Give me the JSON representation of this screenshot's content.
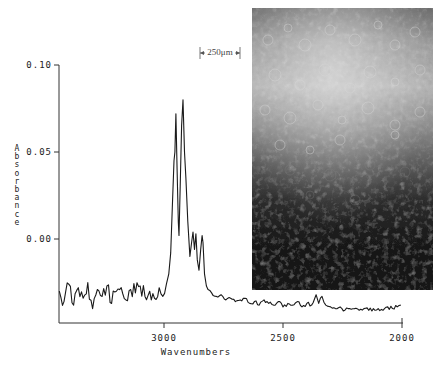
{
  "chart_data": {
    "type": "line",
    "title": "",
    "xlabel": "Wavenumbers",
    "ylabel": "Absorbance",
    "xlim": [
      3445,
      2000
    ],
    "ylim": [
      -0.048,
      0.1
    ],
    "x_reversed": true,
    "grid": false,
    "legend": null,
    "x_ticks": [
      3000,
      2500,
      2000
    ],
    "x_tick_labels": [
      "3000",
      "2500",
      "2000"
    ],
    "y_ticks": [
      0.1,
      0.05,
      0.0
    ],
    "y_tick_labels": [
      "0.10",
      "0.05",
      "0.00"
    ],
    "series": [
      {
        "name": "IR spectrum",
        "x": [
          3440,
          3420,
          3400,
          3380,
          3360,
          3340,
          3320,
          3300,
          3280,
          3260,
          3240,
          3220,
          3200,
          3180,
          3160,
          3140,
          3120,
          3100,
          3080,
          3060,
          3040,
          3020,
          3005,
          2990,
          2980,
          2972,
          2965,
          2958,
          2954,
          2950,
          2945,
          2940,
          2937,
          2932,
          2926,
          2920,
          2914,
          2908,
          2900,
          2891,
          2884,
          2878,
          2872,
          2866,
          2860,
          2853,
          2846,
          2840,
          2836,
          2830,
          2822,
          2815,
          2800,
          2780,
          2760,
          2740,
          2720,
          2700,
          2680,
          2660,
          2640,
          2620,
          2600,
          2580,
          2560,
          2540,
          2520,
          2500,
          2480,
          2460,
          2440,
          2420,
          2400,
          2380,
          2361,
          2350,
          2336,
          2320,
          2300,
          2280,
          2260,
          2240,
          2220,
          2200,
          2180,
          2160,
          2140,
          2120,
          2100,
          2080,
          2060,
          2040,
          2020,
          2005
        ],
        "y": [
          -0.03,
          -0.036,
          -0.026,
          -0.038,
          -0.028,
          -0.034,
          -0.025,
          -0.04,
          -0.029,
          -0.033,
          -0.027,
          -0.037,
          -0.03,
          -0.028,
          -0.035,
          -0.029,
          -0.031,
          -0.027,
          -0.033,
          -0.03,
          -0.034,
          -0.028,
          -0.033,
          -0.026,
          -0.02,
          -0.008,
          0.018,
          0.045,
          0.05,
          0.072,
          0.04,
          0.01,
          0.002,
          0.03,
          0.065,
          0.08,
          0.05,
          0.035,
          0.01,
          -0.01,
          -0.002,
          0.004,
          -0.006,
          0.003,
          -0.012,
          -0.018,
          -0.006,
          0.002,
          -0.002,
          -0.02,
          -0.027,
          -0.029,
          -0.031,
          -0.033,
          -0.032,
          -0.035,
          -0.034,
          -0.036,
          -0.035,
          -0.034,
          -0.037,
          -0.036,
          -0.038,
          -0.035,
          -0.037,
          -0.038,
          -0.036,
          -0.039,
          -0.037,
          -0.038,
          -0.036,
          -0.039,
          -0.037,
          -0.038,
          -0.032,
          -0.037,
          -0.033,
          -0.038,
          -0.039,
          -0.04,
          -0.039,
          -0.041,
          -0.04,
          -0.04,
          -0.041,
          -0.04,
          -0.041,
          -0.04,
          -0.04,
          -0.041,
          -0.039,
          -0.04,
          -0.039,
          -0.038
        ]
      }
    ],
    "annotations": [
      {
        "type": "scale-bar",
        "text": "250μm"
      },
      {
        "type": "inset-image",
        "description": "grayscale micrograph, bright top fading to dark bottom"
      }
    ]
  },
  "labels": {
    "xlabel": "Wavenumbers",
    "ylabel": "Absorbance",
    "scale_bar": "250μm",
    "x_ticks": [
      "3000",
      "2500",
      "2000"
    ],
    "y_ticks": [
      "0.10",
      "0.05",
      "0.00"
    ]
  },
  "colors": {
    "line": "#1a1a1a",
    "axis": "#333333",
    "background": "#ffffff"
  }
}
